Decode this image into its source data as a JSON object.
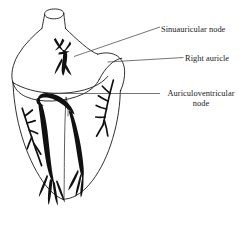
{
  "figure": {
    "kind": "anatomical-line-drawing",
    "background_color": "#ffffff",
    "ink_color": "#1a1a1a",
    "node_fill_color": "#111111",
    "width": 244,
    "height": 238
  },
  "labels": {
    "sinuauricular_node": "Sinuauricular node",
    "right_auricle": "Right auricle",
    "auriculoventricular_node_line1": "Auriculoventricular",
    "auriculoventricular_node_line2": "node"
  },
  "structures": {
    "great_vessel_stump": "great-vessel-stump",
    "atrium": "atrium",
    "right_auricle": "right-auricle",
    "ventricles": "ventricles",
    "sinuauricular_node": "sinuauricular-node",
    "auriculoventricular_node": "auriculoventricular-node",
    "bundle_branches": "bundle-branches",
    "purkinje_fibres": "purkinje-fibres"
  },
  "leaders": {
    "sinuauricular": "leader-line-sinuauricular",
    "right_auricle": "leader-line-right-auricle",
    "auriculoventricular": "leader-line-auriculoventricular"
  }
}
